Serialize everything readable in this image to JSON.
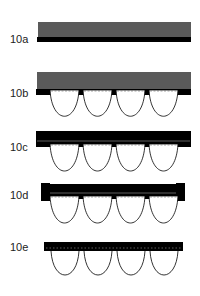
{
  "figures": [
    {
      "id": "10a",
      "label": "10a"
    },
    {
      "id": "10b",
      "label": "10b"
    },
    {
      "id": "10c",
      "label": "10c"
    },
    {
      "id": "10d",
      "label": "10d"
    },
    {
      "id": "10e",
      "label": "10e"
    }
  ],
  "colors": {
    "gray_fill": "#5a5a5a",
    "black_fill": "#000000",
    "outline": "#000000"
  }
}
